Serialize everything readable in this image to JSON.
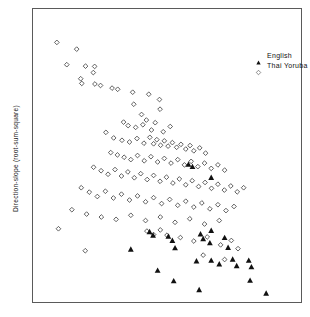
{
  "figure": {
    "ylabel": "Direction-slope (root-sum-square)",
    "xlabel": "",
    "title": "",
    "frame_color": "#5a5a5a",
    "background": "#ffffff"
  },
  "legend": {
    "position": "top-right",
    "entries": [
      {
        "label": "English",
        "marker": "filled-triangle-icon",
        "color": "#111111"
      },
      {
        "label": "Thai Yoruba",
        "marker": "open-diamond-icon",
        "color": "#444444"
      }
    ]
  },
  "chart_data": {
    "type": "scatter",
    "title": "",
    "xlabel": "",
    "ylabel": "Direction-slope (root-sum-square)",
    "xlim": [
      0,
      100
    ],
    "ylim": [
      0,
      100
    ],
    "grid": false,
    "axis_ticks": false,
    "legend_position": "top-right",
    "series": [
      {
        "name": "Thai Yoruba",
        "marker": "open-diamond",
        "color": "#444444",
        "points": [
          [
            8.9,
            88.6
          ],
          [
            16.3,
            86.3
          ],
          [
            12.6,
            81.0
          ],
          [
            19.6,
            80.5
          ],
          [
            23.0,
            80.4
          ],
          [
            22.5,
            78.3
          ],
          [
            17.8,
            76.2
          ],
          [
            18.2,
            74.6
          ],
          [
            23.1,
            74.4
          ],
          [
            25.2,
            73.9
          ],
          [
            29.5,
            73.0
          ],
          [
            31.6,
            72.6
          ],
          [
            37.2,
            71.6
          ],
          [
            43.2,
            70.9
          ],
          [
            37.6,
            67.5
          ],
          [
            47.2,
            69.1
          ],
          [
            47.4,
            65.8
          ],
          [
            40.5,
            64.0
          ],
          [
            42.3,
            62.1
          ],
          [
            33.8,
            61.4
          ],
          [
            35.5,
            60.2
          ],
          [
            38.3,
            59.6
          ],
          [
            41.0,
            60.5
          ],
          [
            44.2,
            58.7
          ],
          [
            45.6,
            61.2
          ],
          [
            48.6,
            58.1
          ],
          [
            51.2,
            59.9
          ],
          [
            27.2,
            57.9
          ],
          [
            30.1,
            56.0
          ],
          [
            33.2,
            55.2
          ],
          [
            36.0,
            54.6
          ],
          [
            38.8,
            55.8
          ],
          [
            41.4,
            54.2
          ],
          [
            43.6,
            56.2
          ],
          [
            45.0,
            54.0
          ],
          [
            46.2,
            55.4
          ],
          [
            47.6,
            53.5
          ],
          [
            49.0,
            55.0
          ],
          [
            50.4,
            53.2
          ],
          [
            52.0,
            54.4
          ],
          [
            53.6,
            52.8
          ],
          [
            55.2,
            53.8
          ],
          [
            57.0,
            52.2
          ],
          [
            58.6,
            53.4
          ],
          [
            60.0,
            51.6
          ],
          [
            62.2,
            52.6
          ],
          [
            64.4,
            50.8
          ],
          [
            29.0,
            51.0
          ],
          [
            31.5,
            50.2
          ],
          [
            34.0,
            49.4
          ],
          [
            36.5,
            48.6
          ],
          [
            39.0,
            50.0
          ],
          [
            41.5,
            48.2
          ],
          [
            44.0,
            49.6
          ],
          [
            46.5,
            47.8
          ],
          [
            49.0,
            49.0
          ],
          [
            51.5,
            47.4
          ],
          [
            54.0,
            48.6
          ],
          [
            56.5,
            46.8
          ],
          [
            59.0,
            48.0
          ],
          [
            61.5,
            46.2
          ],
          [
            64.0,
            47.4
          ],
          [
            66.5,
            45.6
          ],
          [
            69.0,
            46.8
          ],
          [
            71.5,
            45.0
          ],
          [
            22.6,
            46.0
          ],
          [
            25.4,
            44.8
          ],
          [
            28.0,
            43.6
          ],
          [
            30.6,
            45.2
          ],
          [
            33.0,
            43.0
          ],
          [
            35.4,
            44.4
          ],
          [
            37.8,
            42.4
          ],
          [
            40.2,
            43.8
          ],
          [
            42.6,
            41.8
          ],
          [
            45.0,
            43.2
          ],
          [
            47.4,
            41.2
          ],
          [
            49.8,
            42.6
          ],
          [
            52.2,
            40.6
          ],
          [
            54.6,
            42.0
          ],
          [
            57.0,
            40.0
          ],
          [
            59.4,
            41.4
          ],
          [
            61.8,
            39.4
          ],
          [
            64.2,
            40.8
          ],
          [
            66.6,
            38.8
          ],
          [
            69.0,
            40.2
          ],
          [
            71.4,
            38.2
          ],
          [
            73.8,
            39.6
          ],
          [
            76.2,
            37.6
          ],
          [
            78.6,
            39.0
          ],
          [
            18.0,
            39.0
          ],
          [
            21.0,
            37.5
          ],
          [
            24.0,
            36.0
          ],
          [
            27.0,
            37.8
          ],
          [
            30.0,
            35.5
          ],
          [
            33.0,
            36.8
          ],
          [
            36.0,
            34.8
          ],
          [
            39.0,
            36.2
          ],
          [
            42.0,
            34.2
          ],
          [
            45.0,
            35.6
          ],
          [
            48.0,
            33.6
          ],
          [
            51.0,
            35.0
          ],
          [
            54.0,
            33.0
          ],
          [
            57.0,
            34.4
          ],
          [
            60.0,
            32.4
          ],
          [
            63.0,
            33.8
          ],
          [
            66.0,
            31.8
          ],
          [
            69.0,
            33.2
          ],
          [
            72.0,
            31.2
          ],
          [
            75.0,
            32.6
          ],
          [
            14.5,
            31.5
          ],
          [
            20.0,
            30.0
          ],
          [
            25.5,
            29.0
          ],
          [
            31.0,
            28.2
          ],
          [
            36.5,
            29.6
          ],
          [
            42.0,
            27.8
          ],
          [
            47.5,
            29.0
          ],
          [
            53.0,
            27.2
          ],
          [
            58.5,
            28.4
          ],
          [
            64.0,
            26.6
          ],
          [
            69.5,
            27.8
          ],
          [
            9.5,
            25.0
          ],
          [
            19.5,
            17.5
          ],
          [
            42.5,
            24.2
          ],
          [
            45.0,
            23.0
          ],
          [
            47.5,
            24.6
          ],
          [
            50.0,
            22.8
          ],
          [
            55.0,
            22.0
          ],
          [
            60.0,
            20.8
          ],
          [
            65.0,
            22.2
          ],
          [
            70.0,
            19.5
          ],
          [
            74.0,
            21.0
          ],
          [
            76.5,
            18.2
          ],
          [
            63.5,
            16.0
          ],
          [
            71.5,
            14.5
          ]
        ]
      },
      {
        "name": "English",
        "marker": "filled-triangle",
        "color": "#111111",
        "points": [
          [
            58.0,
            47.0
          ],
          [
            59.5,
            46.2
          ],
          [
            66.5,
            42.5
          ],
          [
            43.5,
            24.0
          ],
          [
            44.8,
            22.8
          ],
          [
            50.5,
            22.4
          ],
          [
            52.0,
            21.0
          ],
          [
            53.0,
            18.5
          ],
          [
            62.5,
            23.2
          ],
          [
            66.5,
            24.4
          ],
          [
            63.5,
            21.6
          ],
          [
            66.0,
            20.2
          ],
          [
            71.5,
            22.0
          ],
          [
            72.8,
            18.6
          ],
          [
            36.5,
            18.0
          ],
          [
            61.0,
            14.0
          ],
          [
            66.5,
            14.2
          ],
          [
            69.5,
            13.0
          ],
          [
            74.5,
            14.6
          ],
          [
            76.0,
            12.4
          ],
          [
            80.5,
            14.2
          ],
          [
            81.5,
            12.0
          ],
          [
            46.5,
            10.8
          ],
          [
            52.5,
            7.2
          ],
          [
            81.0,
            7.4
          ],
          [
            62.0,
            4.2
          ],
          [
            87.0,
            3.0
          ]
        ]
      }
    ]
  }
}
